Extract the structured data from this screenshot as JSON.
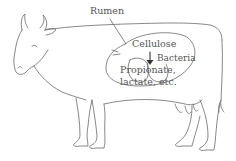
{
  "diagram": {
    "labels": {
      "organ": "Rumen",
      "substrate": "Cellulose",
      "agent": "Bacteria",
      "products_line1": "Propionate,",
      "products_line2": "lactate, etc."
    },
    "arrow": {
      "from": "Cellulose",
      "to": "Propionate, lactate, etc.",
      "via": "Bacteria"
    },
    "colors": {
      "line": "#6a6a6a",
      "text": "#555555",
      "background": "#ffffff"
    }
  }
}
